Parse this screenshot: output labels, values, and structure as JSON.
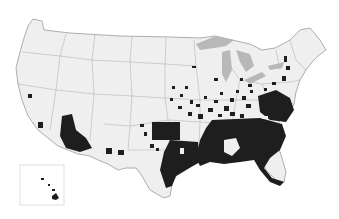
{
  "map": {
    "type": "choropleth",
    "region": "United States (lower 48 + Hawaii inset)",
    "unit": "county",
    "colors": {
      "background": "#ffffff",
      "land": "#efefef",
      "border": "#9a9a9a",
      "water": "#b8b8b8",
      "highlight": "#1e1e1e"
    },
    "highlighted_regions": [
      "Southeast (GA, AL, MS, SC, FL, LA)",
      "Mid-Atlantic coast (VA, MD, NC)",
      "Central / Southern Plains (OK, TX)",
      "Southwest border (AZ)",
      "Scattered Midwest and Northeast counties",
      "Hawaii"
    ],
    "insets": [
      "Hawaii"
    ]
  }
}
